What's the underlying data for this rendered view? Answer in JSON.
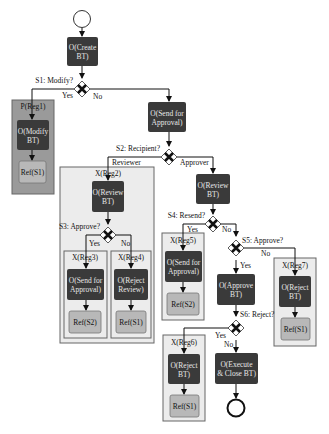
{
  "diagram": {
    "start_event": "start",
    "end_event": "end",
    "tasks": {
      "create": [
        "O(Create",
        "BT)"
      ],
      "modify": [
        "O(Modify",
        "BT)"
      ],
      "send1": [
        "O(Send for",
        "Approval)"
      ],
      "review_main": [
        "O(Review",
        "BT)"
      ],
      "review_x2": [
        "O(Review",
        "BT)"
      ],
      "send_x3": [
        "O(Send for",
        "Approval)"
      ],
      "reject_review": [
        "O(Reject",
        "Review)"
      ],
      "send_x5": [
        "O(Send for",
        "Approval)"
      ],
      "approve": [
        "O(Approve",
        "BT)"
      ],
      "reject_x7": [
        "O(Reject",
        "BT)"
      ],
      "reject_x6": [
        "O(Reject",
        "BT)"
      ],
      "execute": [
        "O(Execute",
        "& Close BT)"
      ]
    },
    "refs": {
      "r1": "Ref(S1)",
      "r3": "Ref(S2)",
      "r4": "Ref(S1)",
      "r5": "Ref(S2)",
      "r7": "Ref(S1)",
      "r6": "Ref(S1)"
    },
    "regions": {
      "reg1": "P(Reg1)",
      "reg2": "X(Reg2)",
      "reg3": "X(Reg3)",
      "reg4": "X(Reg4)",
      "reg5": "X(Reg5)",
      "reg6": "X(Reg6)",
      "reg7": "X(Reg7)"
    },
    "gateways": {
      "s1": "S1: Modify?",
      "s2": "S2: Recipient?",
      "s3": "S3: Approve?",
      "s4": "S4: Resend?",
      "s5": "S5: Approve?",
      "s6": "S6: Reject?"
    },
    "edge_labels": {
      "s1_yes": "Yes",
      "s1_no": "No",
      "s2_reviewer": "Reviewer",
      "s2_approver": "Approver",
      "s3_yes": "Yes",
      "s3_no": "No",
      "s4_yes": "Yes",
      "s4_no": "No",
      "s5_yes": "Yes",
      "s5_no": "No",
      "s6_yes": "Yes",
      "s6_no": "No"
    },
    "colors": {
      "task": "#3a3a3a",
      "ref": "#b8b8b8",
      "p_region": "#9a9a9a",
      "x_region": "#ececec",
      "line": "#111111"
    }
  }
}
